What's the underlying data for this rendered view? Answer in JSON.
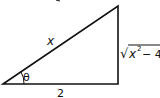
{
  "diagram": {
    "type": "right-triangle",
    "labels": {
      "hypotenuse": "x",
      "angle": "θ",
      "adjacent": "2",
      "opposite": "√x² − 4",
      "opposite_radicand": "x",
      "opposite_exponent": "2",
      "opposite_rest": "− 4",
      "radical": "√"
    },
    "colors": {
      "stroke": "#111111",
      "background": "#ffffff"
    }
  }
}
